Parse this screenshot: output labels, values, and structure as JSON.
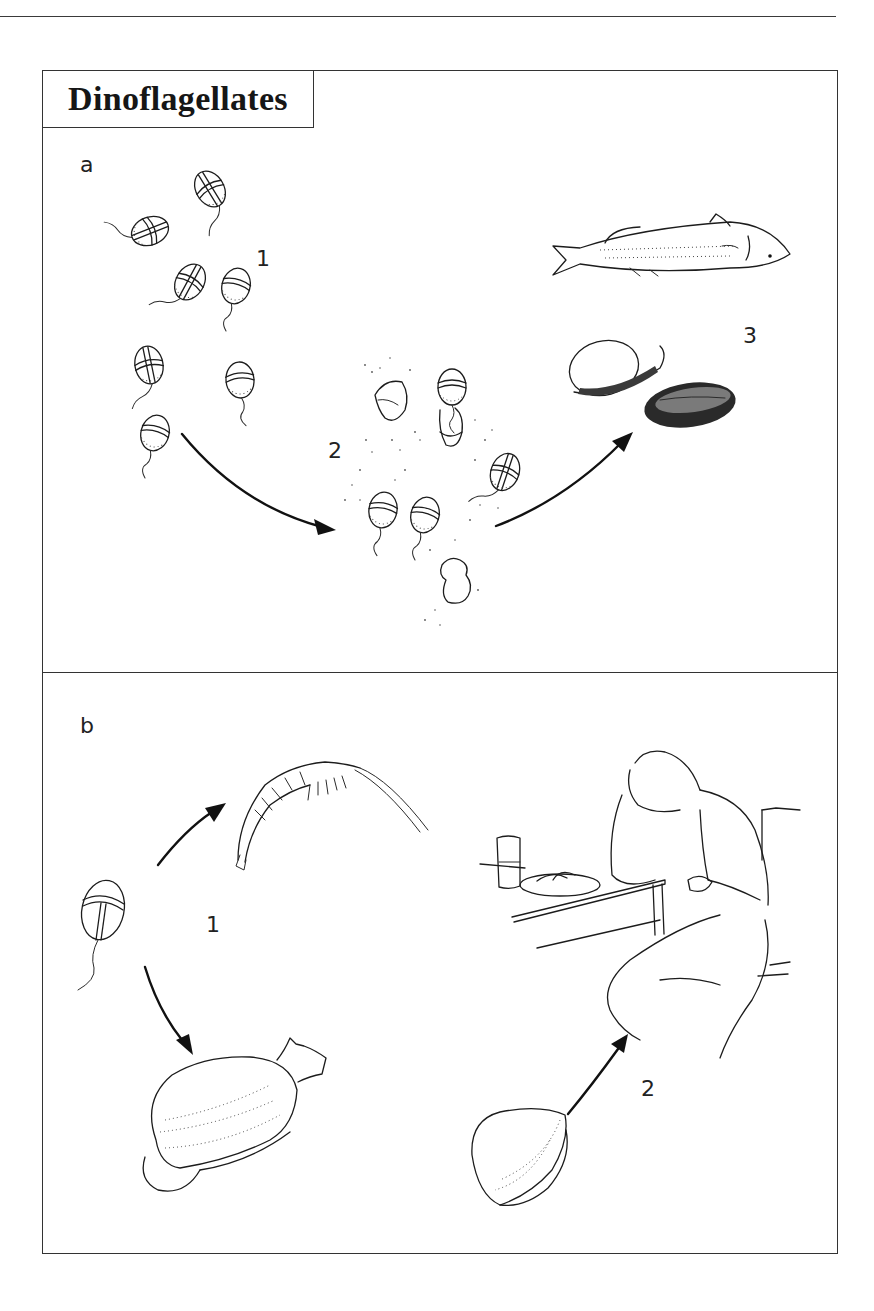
{
  "figure": {
    "title": "Dinoflagellates",
    "panels": [
      {
        "letter": "a",
        "steps": [
          {
            "label": "1",
            "depicts": "free-swimming dinoflagellate cells"
          },
          {
            "label": "2",
            "depicts": "dinoflagellate bloom releasing toxins"
          },
          {
            "label": "3",
            "depicts": "dead fish and contaminated shellfish"
          }
        ]
      },
      {
        "letter": "b",
        "steps": [
          {
            "label": "1",
            "depicts": "dinoflagellate eaten by zooplankton and shellfish"
          },
          {
            "label": "2",
            "depicts": "person sickened after eating shellfish"
          }
        ]
      }
    ]
  }
}
